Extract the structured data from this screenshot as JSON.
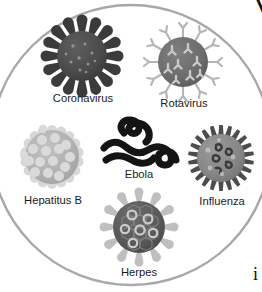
{
  "figure": {
    "name": "virus-types-illustration",
    "style": "grayscale-educational-diagram",
    "background_color": "#ffffff",
    "enclosing_circle": {
      "name": "outline-circle",
      "stroke_color": "#a8a8a8",
      "fill_color": "#ffffff",
      "stroke_width": 2.4,
      "cx": 131,
      "cy": 145,
      "r": 140
    },
    "viruses": [
      {
        "id": "coronavirus",
        "label": "Coronavirus",
        "shape": "sphere-with-club-spikes",
        "cx": 82,
        "cy": 56,
        "r": 26,
        "body_color": "#4d4d4d",
        "spike_color": "#3a3a3a",
        "detail_color": "#9a9a9a",
        "spike_count": 16,
        "label_x": 83,
        "label_y": 102
      },
      {
        "id": "rotavirus",
        "label": "Rotavirus",
        "shape": "sphere-with-y-capsomeres",
        "cx": 183,
        "cy": 62,
        "r": 25,
        "body_color": "#6e6e6e",
        "spike_color": "#b9b9b9",
        "detail_color": "#cfcfcf",
        "spike_count": 12,
        "label_x": 184,
        "label_y": 107
      },
      {
        "id": "hepatitus-b",
        "label": "Hepatitus B",
        "shape": "sphere-with-round-capsomeres",
        "cx": 52,
        "cy": 157,
        "r": 29,
        "body_color": "#b3b3b3",
        "spike_color": "#d6d6d6",
        "detail_color": "#dcdcdc",
        "spike_count": 18,
        "label_x": 53,
        "label_y": 204
      },
      {
        "id": "ebola",
        "label": "Ebola",
        "shape": "filament-looped",
        "cx": 139,
        "cy": 141,
        "body_color": "#141414",
        "stroke_width": 7,
        "label_x": 139,
        "label_y": 178
      },
      {
        "id": "influenza",
        "label": "Influenza",
        "shape": "sphere-with-short-spikes",
        "cx": 221,
        "cy": 158,
        "r": 25,
        "body_color": "#8a8a8a",
        "spike_color": "#4f4f4f",
        "detail_color": "#3d3d3d",
        "spike_count": 22,
        "label_x": 222,
        "label_y": 205
      },
      {
        "id": "herpes",
        "label": "Herpes",
        "shape": "sphere-with-hex-facets-and-rings",
        "cx": 139,
        "cy": 227,
        "r": 27,
        "body_color": "#5a5a5a",
        "spike_color": "#bdbdbd",
        "detail_color": "#c9c9c9",
        "spike_count": 12,
        "label_x": 139,
        "label_y": 276
      }
    ],
    "clipped_text": [
      {
        "id": "top-right-glyph",
        "text": "V",
        "x": 252,
        "y": 14,
        "font_size": 30
      },
      {
        "id": "bottom-right-glyph",
        "text": "i",
        "x": 253,
        "y": 280,
        "font_size": 18
      }
    ]
  }
}
